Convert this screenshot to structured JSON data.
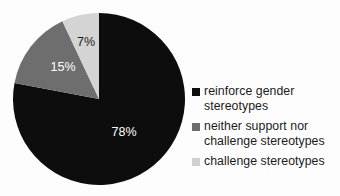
{
  "chart_data": {
    "type": "pie",
    "title": "",
    "categories": [
      "reinforce gender stereotypes",
      "neither support nor challenge stereotypes",
      "challenge stereotypes"
    ],
    "values": [
      78,
      15,
      7
    ],
    "value_labels": [
      "78%",
      "15%",
      "7%"
    ],
    "value_unit": "%",
    "colors": [
      "#0d0d0d",
      "#6e6e6e",
      "#d4d4d4"
    ],
    "label_colors": [
      "#ffffff",
      "#ffffff",
      "#1b1b1b"
    ],
    "start_angle_deg": 0,
    "direction": "clockwise",
    "legend_position": "right",
    "grid": false,
    "xlabel": "",
    "ylabel": ""
  },
  "slices": [
    {
      "name": "reinforce gender stereotypes",
      "value": 78,
      "label": "78%",
      "color": "#0d0d0d",
      "label_color": "#ffffff",
      "label_x": 112,
      "label_y": 121
    },
    {
      "name": "neither support nor challenge stereotypes",
      "value": 15,
      "label": "15%",
      "color": "#6e6e6e",
      "label_color": "#ffffff",
      "label_x": 51,
      "label_y": 56
    },
    {
      "name": "challenge stereotypes",
      "value": 7,
      "label": "7%",
      "color": "#d4d4d4",
      "label_color": "#1b1b1b",
      "label_x": 74,
      "label_y": 31
    }
  ],
  "legend": {
    "items": [
      {
        "label": "reinforce gender stereotypes",
        "swatch_name": "legend-swatch-reinforce",
        "color": "#0d0d0d"
      },
      {
        "label": " neither support nor challenge stereotypes",
        "swatch_name": "legend-swatch-neither",
        "color": "#6e6e6e"
      },
      {
        "label": "challenge stereotypes",
        "swatch_name": "legend-swatch-challenge",
        "color": "#cfcfcf"
      }
    ]
  }
}
